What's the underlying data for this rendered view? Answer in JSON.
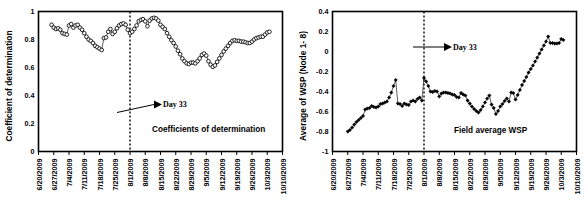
{
  "figure": {
    "background": "#ffffff",
    "panel_count": 2
  },
  "chart_data": [
    {
      "id": "coefficient-of-determination",
      "type": "line",
      "title": "",
      "series_label": "Coefficients of determination",
      "marker": "open-circle",
      "xlabel": "",
      "ylabel": "Coefficient of determination",
      "ylim": [
        0,
        1
      ],
      "yticks": [
        0,
        0.2,
        0.4,
        0.6,
        0.8,
        1
      ],
      "ytick_labels": [
        "0",
        "0.2",
        "0.4",
        "0.6",
        "0.8",
        "1"
      ],
      "xtick_labels": [
        "6/20/2009",
        "6/27/2009",
        "7/4/2009",
        "7/11/2009",
        "7/18/2009",
        "7/25/2009",
        "8/1/2009",
        "8/8/2009",
        "8/15/2009",
        "8/22/2009",
        "8/29/2009",
        "9/5/2009",
        "9/12/2009",
        "9/19/2009",
        "9/26/2009",
        "10/3/2009",
        "10/10/2009"
      ],
      "xlim_days": [
        0,
        112
      ],
      "grid": false,
      "legend": "none",
      "annotation": {
        "text": "Day 33",
        "marker_day": 42,
        "line_style": "dotted-vertical"
      },
      "x": [
        6,
        7,
        8,
        9,
        10,
        11,
        12,
        13,
        14,
        15,
        16,
        17,
        18,
        19,
        20,
        21,
        22,
        23,
        24,
        25,
        26,
        27,
        28,
        29,
        30,
        31,
        32,
        33,
        34,
        35,
        36,
        37,
        38,
        39,
        40,
        41,
        42,
        43,
        44,
        45,
        46,
        47,
        48,
        49,
        50,
        51,
        52,
        53,
        54,
        55,
        56,
        57,
        58,
        59,
        60,
        61,
        62,
        63,
        64,
        65,
        66,
        67,
        68,
        69,
        70,
        71,
        72,
        73,
        74,
        75,
        76,
        77,
        78,
        79,
        80,
        81,
        82,
        83,
        84,
        85,
        86,
        87,
        88,
        89,
        90,
        91,
        92,
        93,
        94,
        95,
        96,
        97,
        98,
        99,
        100,
        101,
        102,
        103,
        104,
        105,
        106
      ],
      "values": [
        0.905,
        0.885,
        0.875,
        0.88,
        0.87,
        0.845,
        0.84,
        0.835,
        0.9,
        0.91,
        0.885,
        0.9,
        0.905,
        0.885,
        0.87,
        0.845,
        0.82,
        0.8,
        0.79,
        0.775,
        0.755,
        0.745,
        0.735,
        0.725,
        0.81,
        0.815,
        0.855,
        0.875,
        0.84,
        0.855,
        0.88,
        0.9,
        0.91,
        0.915,
        0.905,
        0.87,
        0.845,
        0.855,
        0.875,
        0.9,
        0.93,
        0.94,
        0.945,
        0.93,
        0.895,
        0.935,
        0.95,
        0.955,
        0.95,
        0.935,
        0.905,
        0.89,
        0.875,
        0.845,
        0.82,
        0.795,
        0.775,
        0.75,
        0.72,
        0.695,
        0.665,
        0.645,
        0.63,
        0.625,
        0.635,
        0.635,
        0.63,
        0.645,
        0.665,
        0.69,
        0.7,
        0.685,
        0.645,
        0.62,
        0.605,
        0.615,
        0.64,
        0.665,
        0.69,
        0.715,
        0.735,
        0.755,
        0.775,
        0.79,
        0.795,
        0.79,
        0.79,
        0.785,
        0.785,
        0.78,
        0.775,
        0.775,
        0.785,
        0.8,
        0.81,
        0.815,
        0.82,
        0.82,
        0.835,
        0.85,
        0.855,
        0.86
      ]
    },
    {
      "id": "field-average-wsp",
      "type": "line",
      "title": "",
      "series_label": "Field average WSP",
      "marker": "filled-diamond",
      "xlabel": "",
      "ylabel": "Average of WSP (Node 1- 8)",
      "ylim": [
        -1,
        0.4
      ],
      "yticks": [
        -1,
        -0.8,
        -0.6,
        -0.4,
        -0.2,
        0,
        0.2,
        0.4
      ],
      "ytick_labels": [
        "-1",
        "-0.8",
        "-0.6",
        "-0.4",
        "-0.2",
        "0",
        "0.2",
        "0.4"
      ],
      "xtick_labels": [
        "6/20/2009",
        "6/27/2009",
        "7/4/2009",
        "7/11/2009",
        "7/18/2009",
        "7/25/2009",
        "8/1/2009",
        "8/8/2009",
        "8/15/2009",
        "8/22/2009",
        "8/29/2009",
        "9/5/2009",
        "9/12/2009",
        "9/19/2009",
        "9/26/2009",
        "10/3/2009",
        "10/10/2009"
      ],
      "xlim_days": [
        0,
        112
      ],
      "grid": false,
      "legend": "none",
      "annotation": {
        "text": "Day 33",
        "marker_day": 42,
        "line_style": "dotted-vertical"
      },
      "x": [
        7,
        8,
        9,
        10,
        11,
        12,
        13,
        14,
        15,
        16,
        17,
        18,
        19,
        20,
        21,
        22,
        23,
        24,
        25,
        26,
        27,
        28,
        29,
        30,
        31,
        32,
        33,
        34,
        35,
        36,
        37,
        38,
        39,
        40,
        41,
        42,
        43,
        44,
        45,
        46,
        47,
        48,
        49,
        50,
        51,
        52,
        53,
        54,
        55,
        56,
        57,
        58,
        59,
        60,
        61,
        62,
        63,
        64,
        65,
        66,
        67,
        68,
        69,
        70,
        71,
        72,
        73,
        74,
        75,
        76,
        77,
        78,
        79,
        80,
        81,
        82,
        83,
        84,
        85,
        86,
        87,
        88,
        89,
        90,
        91,
        92,
        93,
        94,
        95,
        96,
        97,
        98,
        99,
        100,
        101,
        102,
        103,
        104,
        105,
        106
      ],
      "values": [
        -0.8,
        -0.785,
        -0.76,
        -0.73,
        -0.705,
        -0.685,
        -0.665,
        -0.645,
        -0.58,
        -0.57,
        -0.565,
        -0.545,
        -0.555,
        -0.56,
        -0.55,
        -0.525,
        -0.52,
        -0.51,
        -0.5,
        -0.46,
        -0.41,
        -0.345,
        -0.285,
        -0.52,
        -0.525,
        -0.545,
        -0.52,
        -0.53,
        -0.535,
        -0.5,
        -0.49,
        -0.5,
        -0.475,
        -0.46,
        -0.49,
        -0.265,
        -0.3,
        -0.345,
        -0.4,
        -0.405,
        -0.395,
        -0.4,
        -0.45,
        -0.42,
        -0.41,
        -0.41,
        -0.415,
        -0.42,
        -0.43,
        -0.435,
        -0.455,
        -0.46,
        -0.415,
        -0.43,
        -0.44,
        -0.49,
        -0.52,
        -0.55,
        -0.575,
        -0.595,
        -0.61,
        -0.585,
        -0.55,
        -0.51,
        -0.47,
        -0.44,
        -0.53,
        -0.565,
        -0.625,
        -0.595,
        -0.55,
        -0.525,
        -0.495,
        -0.47,
        -0.5,
        -0.41,
        -0.415,
        -0.48,
        -0.435,
        -0.385,
        -0.335,
        -0.295,
        -0.255,
        -0.21,
        -0.175,
        -0.14,
        -0.1,
        -0.06,
        -0.02,
        0.02,
        0.06,
        0.1,
        0.15,
        0.085,
        0.085,
        0.08,
        0.08,
        0.085,
        0.125,
        0.115
      ]
    }
  ]
}
